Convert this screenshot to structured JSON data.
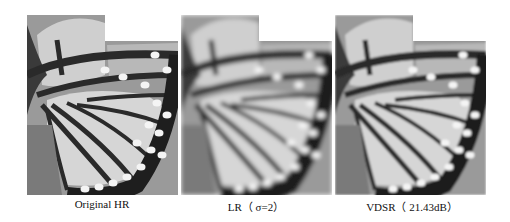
{
  "figure": {
    "panels": [
      {
        "id": "hr",
        "caption": "Original HR",
        "blur": 0
      },
      {
        "id": "lr",
        "caption": "LR（ σ=2）",
        "blur": 2.2
      },
      {
        "id": "vdsr",
        "caption": "VDSR（ 21.43dB）",
        "blur": 1.3
      }
    ]
  }
}
